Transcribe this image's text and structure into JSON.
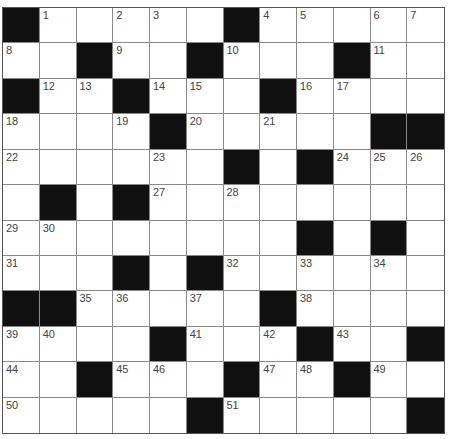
{
  "puzzle": {
    "rows": 12,
    "cols": 12,
    "colors": {
      "block": "#111111",
      "cell": "#ffffff",
      "line": "#8a8a8a",
      "number": "#444444"
    },
    "grid": [
      [
        "#",
        "1",
        "",
        "2",
        "3",
        "",
        "#",
        "4",
        "5",
        "",
        "6",
        "7"
      ],
      [
        "8",
        "",
        "#",
        "9",
        "",
        "#",
        "10",
        "",
        "",
        "#",
        "11",
        ""
      ],
      [
        "#",
        "12",
        "13",
        "#",
        "14",
        "15",
        "",
        "#",
        "16",
        "17",
        "",
        ""
      ],
      [
        "18",
        "",
        "",
        "19",
        "#",
        "20",
        "",
        "21",
        "",
        "",
        "#",
        "#"
      ],
      [
        "22",
        "",
        "",
        "",
        "23",
        "",
        "#",
        "",
        "#",
        "24",
        "25",
        "26"
      ],
      [
        "",
        "#",
        "",
        "#",
        "27",
        "",
        "28",
        "",
        "",
        "",
        "",
        ""
      ],
      [
        "29",
        "30",
        "",
        "",
        "",
        "",
        "",
        "",
        "#",
        "",
        "#",
        ""
      ],
      [
        "31",
        "",
        "",
        "#",
        "",
        "#",
        "32",
        "",
        "33",
        "",
        "34",
        ""
      ],
      [
        "#",
        "#",
        "35",
        "36",
        "",
        "37",
        "",
        "#",
        "38",
        "",
        "",
        ""
      ],
      [
        "39",
        "40",
        "",
        "",
        "#",
        "41",
        "",
        "42",
        "#",
        "43",
        "",
        "#"
      ],
      [
        "44",
        "",
        "#",
        "45",
        "46",
        "",
        "#",
        "47",
        "48",
        "#",
        "49",
        ""
      ],
      [
        "50",
        "",
        "",
        "",
        "",
        "#",
        "51",
        "",
        "",
        "",
        "",
        "#"
      ]
    ]
  }
}
